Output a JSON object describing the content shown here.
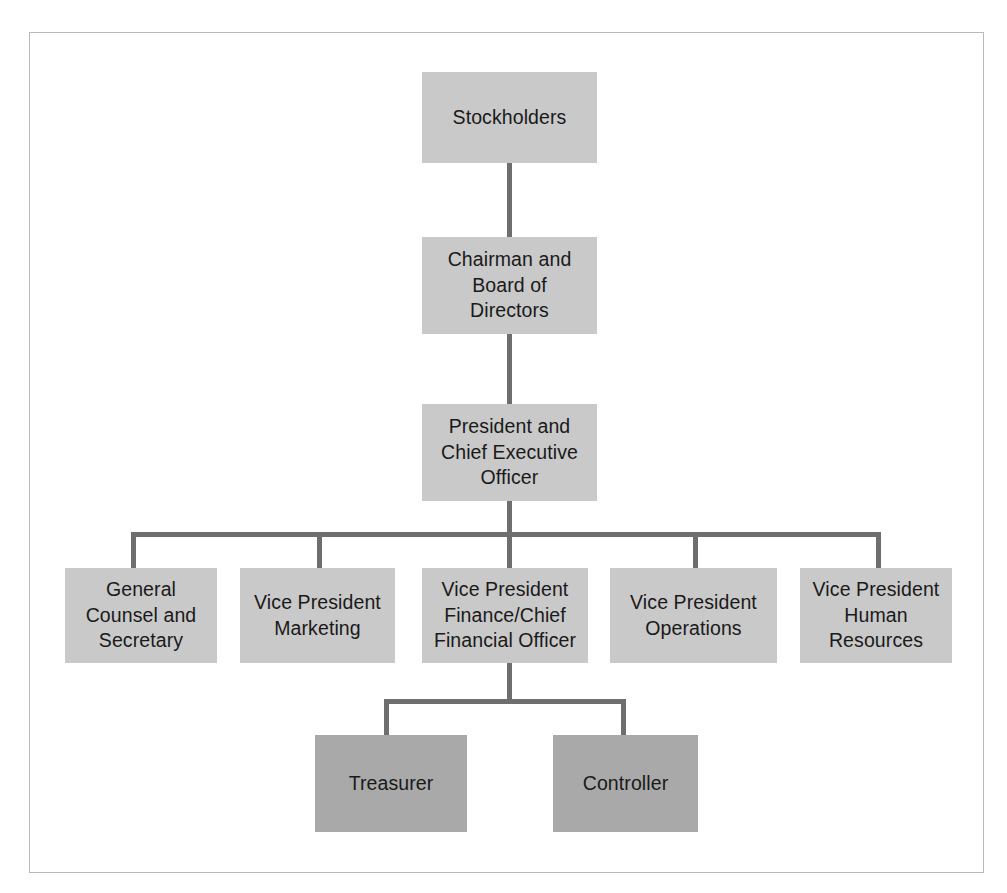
{
  "diagram": {
    "colors": {
      "box_light": "#c9c9c9",
      "box_dark": "#a9a9a9",
      "connector": "#6e6e6e",
      "frame_border": "#b9b9b9",
      "background": "#ffffff",
      "text": "#1a1a1a"
    },
    "nodes": [
      {
        "id": "stockholders",
        "label": "Stockholders",
        "level": 1,
        "shade": "light",
        "x": 422,
        "y": 72,
        "w": 175,
        "h": 91
      },
      {
        "id": "chairman-board",
        "label": "Chairman and\nBoard of\nDirectors",
        "level": 2,
        "shade": "light",
        "x": 422,
        "y": 237,
        "w": 175,
        "h": 97
      },
      {
        "id": "president-ceo",
        "label": "President and\nChief Executive\nOfficer",
        "level": 3,
        "shade": "light",
        "x": 422,
        "y": 404,
        "w": 175,
        "h": 97
      },
      {
        "id": "general-counsel",
        "label": "General\nCounsel and\nSecretary",
        "level": 4,
        "shade": "light",
        "x": 65,
        "y": 568,
        "w": 152,
        "h": 95
      },
      {
        "id": "vp-marketing",
        "label": "Vice President\nMarketing",
        "level": 4,
        "shade": "light",
        "x": 240,
        "y": 568,
        "w": 155,
        "h": 95
      },
      {
        "id": "vp-finance-cfo",
        "label": "Vice President\nFinance/Chief\nFinancial Officer",
        "level": 4,
        "shade": "light",
        "x": 422,
        "y": 568,
        "w": 166,
        "h": 95
      },
      {
        "id": "vp-operations",
        "label": "Vice President\nOperations",
        "level": 4,
        "shade": "light",
        "x": 610,
        "y": 568,
        "w": 167,
        "h": 95
      },
      {
        "id": "vp-human-resources",
        "label": "Vice President\nHuman\nResources",
        "level": 4,
        "shade": "light",
        "x": 800,
        "y": 568,
        "w": 152,
        "h": 95
      },
      {
        "id": "treasurer",
        "label": "Treasurer",
        "level": 5,
        "shade": "dark",
        "x": 315,
        "y": 735,
        "w": 152,
        "h": 97
      },
      {
        "id": "controller",
        "label": "Controller",
        "level": 5,
        "shade": "dark",
        "x": 553,
        "y": 735,
        "w": 145,
        "h": 97
      }
    ],
    "edges": [
      {
        "from": "stockholders",
        "to": "chairman-board",
        "type": "vertical"
      },
      {
        "from": "chairman-board",
        "to": "president-ceo",
        "type": "vertical"
      },
      {
        "from": "president-ceo",
        "to": "general-counsel",
        "type": "elbow"
      },
      {
        "from": "president-ceo",
        "to": "vp-marketing",
        "type": "elbow"
      },
      {
        "from": "president-ceo",
        "to": "vp-finance-cfo",
        "type": "vertical"
      },
      {
        "from": "president-ceo",
        "to": "vp-operations",
        "type": "elbow"
      },
      {
        "from": "president-ceo",
        "to": "vp-human-resources",
        "type": "elbow"
      },
      {
        "from": "vp-finance-cfo",
        "to": "treasurer",
        "type": "elbow"
      },
      {
        "from": "vp-finance-cfo",
        "to": "controller",
        "type": "elbow"
      }
    ]
  }
}
